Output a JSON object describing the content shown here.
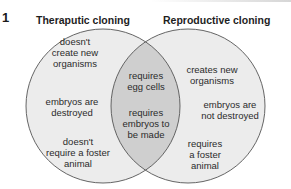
{
  "figure_number": "1",
  "left_set": {
    "title": "Theraputic cloning",
    "items": [
      {
        "line1": "doesn't",
        "line2": "create new",
        "line3": "organisms"
      },
      {
        "line1": "embryos are",
        "line2": "destroyed",
        "line3": ""
      },
      {
        "line1": "doesn't",
        "line2": "require a foster",
        "line3": "animal"
      }
    ]
  },
  "right_set": {
    "title": "Reproductive cloning",
    "items": [
      {
        "line1": "creates new",
        "line2": "organisms",
        "line3": ""
      },
      {
        "line1": "embryos are",
        "line2": "not destroyed",
        "line3": ""
      },
      {
        "line1": "requires",
        "line2": "a foster",
        "line3": "animal"
      }
    ]
  },
  "intersection": {
    "items": [
      {
        "line1": "requires",
        "line2": "egg cells",
        "line3": ""
      },
      {
        "line1": "requires",
        "line2": "embryos to",
        "line3": "be made"
      }
    ]
  },
  "colors": {
    "circle_fill": "#ececec",
    "overlap_fill": "#cfcfcf",
    "stroke": "#555555"
  }
}
